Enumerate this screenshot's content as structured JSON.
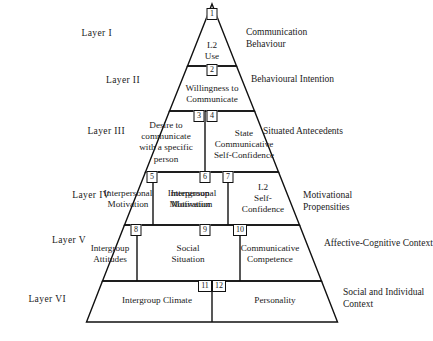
{
  "diagram": {
    "type": "pyramid",
    "layers": [
      {
        "id": "layer-1",
        "label": "Layer  I",
        "side_label": "Communication\nBehaviour",
        "cells": [
          {
            "num": "1",
            "text": "L2\nUse"
          }
        ]
      },
      {
        "id": "layer-2",
        "label": "Layer  II",
        "side_label": "Behavioural Intention",
        "cells": [
          {
            "num": "2",
            "text": "Willingness to\nCommunicate"
          }
        ]
      },
      {
        "id": "layer-3",
        "label": "Layer  III",
        "side_label": "Situated Antecedents",
        "cells": [
          {
            "num": "3",
            "text": "Desire to\ncommunicate\nwith a specific\nperson"
          },
          {
            "num": "4",
            "text": "State\nCommunicative\nSelf-Confidence"
          }
        ]
      },
      {
        "id": "layer-4",
        "label": "Layer  IV",
        "side_label": "Motivational\nPropensities",
        "cells": [
          {
            "num": "5",
            "text": "Interpersonal\nMotivation"
          },
          {
            "num": "6",
            "text": "Intergroup\nMotivation"
          },
          {
            "num": "7",
            "text": "L2\nSelf-\nConfidence"
          }
        ]
      },
      {
        "id": "layer-5",
        "label": "Layer  V",
        "side_label": "Affective-Cognitive Context",
        "cells": [
          {
            "num": "8",
            "text": "Intergroup\nAttitudes"
          },
          {
            "num": "9",
            "text": "Social\nSituation"
          },
          {
            "num": "10",
            "text": "Communicative\nCompetence"
          }
        ]
      },
      {
        "id": "layer-6",
        "label": "Layer  VI",
        "side_label": "Social and Individual\nContext",
        "cells": [
          {
            "num": "11",
            "text": "Intergroup Climate"
          },
          {
            "num": "12",
            "text": "Personality"
          }
        ]
      }
    ],
    "colors": {
      "stroke": "#111111",
      "background": "#ffffff",
      "text": "#1a1a1a"
    }
  }
}
